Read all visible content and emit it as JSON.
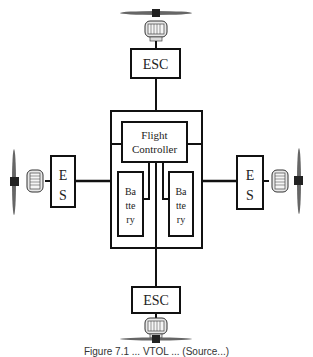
{
  "diagram": {
    "type": "quadcopter-block-diagram",
    "nodes": {
      "flight_controller": {
        "label_line1": "Flight",
        "label_line2": "Controller"
      },
      "esc_top": {
        "label": "ESC"
      },
      "esc_bottom": {
        "label": "ESC"
      },
      "esc_left": {
        "label_line1": "E",
        "label_line2": "S"
      },
      "esc_right": {
        "label_line1": "E",
        "label_line2": "S"
      },
      "battery_left": {
        "label_line1": "Ba",
        "label_line2": "tte",
        "label_line3": "ry"
      },
      "battery_right": {
        "label_line1": "Ba",
        "label_line2": "tte",
        "label_line3": "ry"
      }
    },
    "motors": [
      "top",
      "left",
      "right",
      "bottom"
    ],
    "propellers": [
      "top",
      "left",
      "right",
      "bottom"
    ],
    "edges": [
      [
        "motor_top",
        "esc_top"
      ],
      [
        "esc_top",
        "frame"
      ],
      [
        "motor_left",
        "esc_left"
      ],
      [
        "esc_left",
        "frame"
      ],
      [
        "motor_right",
        "esc_right"
      ],
      [
        "esc_right",
        "frame"
      ],
      [
        "frame",
        "esc_bottom"
      ],
      [
        "esc_bottom",
        "motor_bottom"
      ],
      [
        "flight_controller",
        "battery_left"
      ],
      [
        "flight_controller",
        "battery_right"
      ],
      [
        "flight_controller",
        "frame"
      ]
    ],
    "colors": {
      "stroke": "#111111",
      "motor_fill": "#e6e6e6",
      "hub": "#222222"
    }
  },
  "caption": {
    "text": "Figure 7.1 ... VTOL ... (Source...)"
  }
}
